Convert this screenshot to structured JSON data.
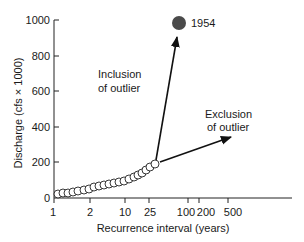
{
  "chart_data": {
    "type": "scatter",
    "title": "",
    "xlabel": "Recurrence interval (years)",
    "ylabel": "Discharge (cfs × 1000)",
    "xscale": "probability (nonlinear)",
    "ylim": [
      0,
      1000
    ],
    "x_ticks": [
      "1",
      "2",
      "10",
      "25",
      "100",
      "200",
      "500"
    ],
    "y_ticks": [
      "0",
      "200",
      "400",
      "600",
      "800",
      "1000"
    ],
    "grid": false,
    "series": [
      {
        "name": "Annual peak discharges",
        "marker": "open-circle",
        "points_px": [
          [
            58,
            194
          ],
          [
            63,
            193
          ],
          [
            68,
            193
          ],
          [
            73,
            192
          ],
          [
            78,
            191
          ],
          [
            84,
            190
          ],
          [
            89,
            189
          ],
          [
            94,
            187
          ],
          [
            99,
            186
          ],
          [
            104,
            185
          ],
          [
            109,
            184
          ],
          [
            114,
            183
          ],
          [
            119,
            182
          ],
          [
            124,
            181
          ],
          [
            129,
            179
          ],
          [
            134,
            177
          ],
          [
            138,
            175
          ],
          [
            142,
            173
          ],
          [
            146,
            170
          ],
          [
            150,
            167
          ],
          [
            155,
            164
          ]
        ],
        "discharge_values": [
          22,
          28,
          28,
          34,
          39,
          45,
          51,
          62,
          67,
          73,
          79,
          84,
          90,
          96,
          107,
          118,
          129,
          140,
          157,
          174,
          191
        ]
      },
      {
        "name": "1954 outlier",
        "marker": "filled-circle",
        "recurrence_interval_approx": 70,
        "discharge_value": 983,
        "color": "#4a4a4a"
      }
    ],
    "annotations": [
      {
        "text": "1954",
        "anchor": "outlier point"
      },
      {
        "text": "Inclusion of outlier",
        "type": "arrow",
        "direction": "toward 1954 point"
      },
      {
        "text": "Exclusion of outlier",
        "type": "arrow",
        "direction": "low-slope extrapolation"
      }
    ]
  },
  "labels": {
    "xlabel": "Recurrence interval (years)",
    "ylabel": "Discharge (cfs × 1000)",
    "outlier_year": "1954",
    "inclusion_line1": "Inclusion",
    "inclusion_line2": "of outlier",
    "exclusion_line1": "Exclusion",
    "exclusion_line2": "of outlier",
    "yticks": [
      "1000",
      "800",
      "600",
      "400",
      "200",
      "0"
    ],
    "xticks": [
      "1",
      "2",
      "10",
      "25",
      "100",
      "200",
      "500"
    ]
  },
  "colors": {
    "axis": "#222222",
    "outlier_fill": "#4a4a4a",
    "circle_stroke": "#222222"
  }
}
